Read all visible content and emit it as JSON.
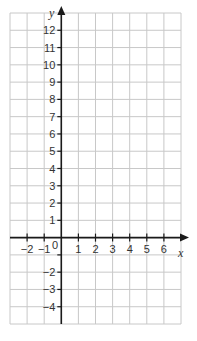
{
  "chart_data": {
    "type": "scatter",
    "title": "",
    "xlabel": "x",
    "ylabel": "y",
    "xlim": [
      -3,
      7
    ],
    "ylim": [
      -5,
      13
    ],
    "grid": true,
    "x_ticks": [
      -2,
      -1,
      1,
      2,
      3,
      4,
      5,
      6
    ],
    "y_ticks": [
      -4,
      -3,
      -2,
      -1,
      1,
      2,
      3,
      4,
      5,
      6,
      7,
      8,
      9,
      10,
      11,
      12
    ],
    "origin_label": "0",
    "series": []
  },
  "labels": {
    "x_axis": "x",
    "y_axis": "y",
    "origin": "0"
  },
  "colors": {
    "grid": "#c8c8c8",
    "axis": "#1a1a1a",
    "text": "#333333"
  }
}
